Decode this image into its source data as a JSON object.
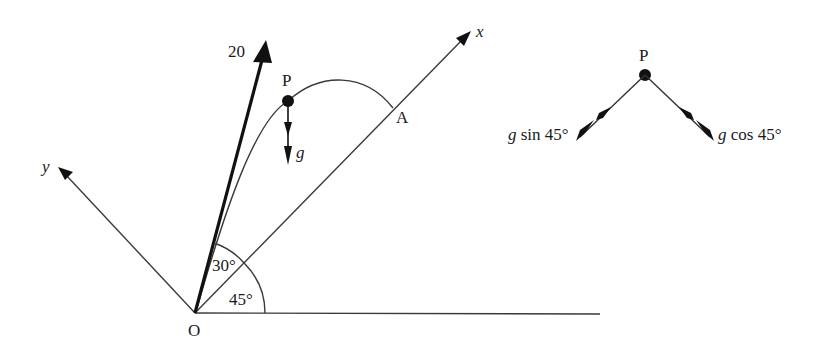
{
  "diagram": {
    "main": {
      "origin_label": "O",
      "x_axis_label": "x",
      "y_axis_label": "y",
      "velocity_label": "20",
      "particle_label": "P",
      "landing_label": "A",
      "gravity_label": "g",
      "angle_incline_label": "45°",
      "angle_projection_label": "30°"
    },
    "components": {
      "particle_label": "P",
      "component_x_label": "g sin 45°",
      "component_y_label": "g cos 45°",
      "component_x_prefix": "g",
      "component_x_suffix": " sin 45°",
      "component_y_prefix": "g",
      "component_y_suffix": " cos 45°"
    },
    "colors": {
      "ink": "#1a1a1a",
      "background": "#ffffff"
    }
  }
}
